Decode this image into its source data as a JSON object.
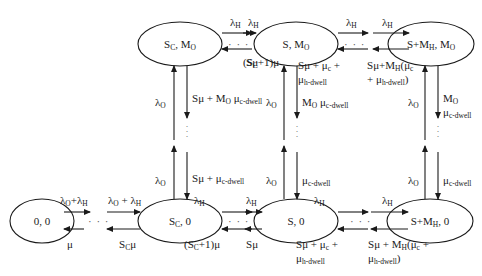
{
  "diagram": {
    "type": "state-transition-diagram",
    "nodes": {
      "n00": {
        "main": "0, 0"
      },
      "nSc0": {
        "pre": "S",
        "sub": "C",
        "post": ", 0"
      },
      "nS0": {
        "main": "S, 0"
      },
      "nSMh0": {
        "pre": "S+M",
        "sub": "H",
        "post": ", 0"
      },
      "nScMo": {
        "pre": "S",
        "sub": "C",
        "mid": ", M",
        "sub2": "O"
      },
      "nSMo": {
        "pre": "S, M",
        "sub": "O"
      },
      "nSMhMo": {
        "pre": "S+M",
        "sub": "H",
        "mid": ", M",
        "sub2": "O"
      }
    },
    "labels": {
      "lam": "λ",
      "mu": "μ",
      "H": "H",
      "O": "O",
      "C": "C",
      "top_fwd1": "λ_H",
      "top_fwd2": "λ_H",
      "top_fwd3": "λ_H",
      "top_fwd4": "λ_H",
      "top_back1": "(S_C+1)μ",
      "top_back2": "Sμ",
      "top_back3": "Sμ + μ_c + μ_h-dwell",
      "top_back4": "Sμ+M_H(μ_c + μ_h-dwell)",
      "bot_fwd0": "λ_O+λ_H",
      "bot_fwd1": "λ_O+ λ_H",
      "bot_fwd2": "λ_H",
      "bot_fwd3": "λ_H",
      "bot_fwd4": "λ_H",
      "bot_fwd5": "λ_H",
      "bot_back0": "μ",
      "bot_back1": "S_Cμ",
      "bot_back2": "(S_C+1)μ",
      "bot_back3": "Sμ",
      "bot_back4": "Sμ + μ_c + μ_h-dwell",
      "bot_back5": "Sμ + M_H(μ_c + μ_h-dwell)",
      "col1_up_top": "λ_O",
      "col1_down_top": "Sμ + M_O μ_c-dwell",
      "col1_up_bot": "λ_O",
      "col1_down_bot": "Sμ + μ_c-dwell",
      "col2_up_top": "λ_O",
      "col2_down_top": "M_O μ_c-dwell",
      "col2_up_bot": "λ_O",
      "col2_down_bot": "μ_c-dwell",
      "col3_up_top": "λ_O",
      "col3_down_top": "M_O μ_c-dwell",
      "col3_up_bot": "λ_O",
      "col3_down_bot": "μ_c-dwell"
    },
    "text": {
      "plus": " + ",
      "plus_nospace": "+",
      "sp": " ",
      "S": "S",
      "M": "M",
      "c": "c",
      "cdwell": "c-dwell",
      "hdwell": "h-dwell",
      "lp": "(",
      "rp": ")",
      "one": "+1)",
      "dots": "· · ·"
    }
  }
}
